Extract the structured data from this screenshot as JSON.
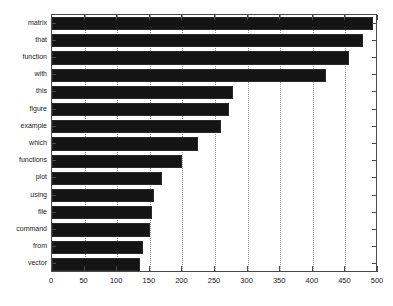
{
  "chart_data": {
    "type": "bar",
    "orientation": "horizontal",
    "title": "",
    "xlabel": "",
    "ylabel": "",
    "categories": [
      "matrix",
      "that",
      "function",
      "with",
      "this",
      "figure",
      "example",
      "which",
      "functions",
      "plot",
      "using",
      "file",
      "command",
      "from",
      "vector"
    ],
    "values": [
      492,
      477,
      455,
      420,
      278,
      272,
      259,
      224,
      200,
      168,
      157,
      153,
      150,
      140,
      135
    ],
    "xlim": [
      0,
      500
    ],
    "xticks": [
      0,
      50,
      100,
      150,
      200,
      250,
      300,
      350,
      400,
      450,
      500
    ],
    "xtick_labels": [
      "0",
      "50",
      "100",
      "150",
      "200",
      "250",
      "300",
      "350",
      "400",
      "450",
      "500"
    ],
    "grid": true,
    "grid_axis": "x",
    "grid_style": "dotted",
    "legend": null,
    "bar_color": "#141414",
    "background_color": "#ffffff",
    "axis_color": "#4a4a4a",
    "grid_color": "#9a9a9a"
  },
  "figure": {
    "name": "word-frequency-bar-chart"
  }
}
